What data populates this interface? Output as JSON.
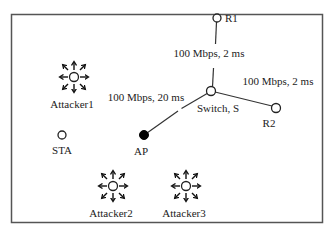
{
  "diagram": {
    "type": "network-topology",
    "colors": {
      "border": "#555555",
      "line": "#333333",
      "node_stroke": "#222222",
      "node_fill_open": "#ffffff",
      "node_fill_ap": "#000000",
      "text": "#222222"
    },
    "nodes": {
      "r1": {
        "label": "R1",
        "kind": "router"
      },
      "switch": {
        "label": "Switch, S",
        "kind": "switch"
      },
      "r2": {
        "label": "R2",
        "kind": "router"
      },
      "ap": {
        "label": "AP",
        "kind": "access-point"
      },
      "sta": {
        "label": "STA",
        "kind": "station"
      },
      "attacker1": {
        "label": "Attacker1",
        "kind": "attacker"
      },
      "attacker2": {
        "label": "Attacker2",
        "kind": "attacker"
      },
      "attacker3": {
        "label": "Attacker3",
        "kind": "attacker"
      }
    },
    "links": {
      "r1_switch": {
        "from": "R1",
        "to": "Switch, S",
        "label": "100 Mbps, 2 ms"
      },
      "switch_r2": {
        "from": "Switch, S",
        "to": "R2",
        "label": "100 Mbps, 2 ms"
      },
      "ap_switch": {
        "from": "AP",
        "to": "Switch, S",
        "label": "100 Mbps, 20 ms"
      }
    }
  }
}
